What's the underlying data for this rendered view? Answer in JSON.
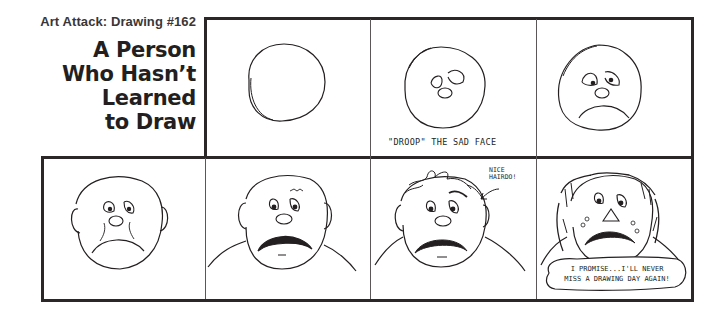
{
  "header": {
    "kicker": "Art Attack: Drawing #162",
    "title_lines": [
      "A Person",
      "Who Hasn’t",
      "Learned",
      "to Draw"
    ]
  },
  "panels": [
    {
      "index": 1,
      "row": 1,
      "description": "plain circle",
      "caption": ""
    },
    {
      "index": 2,
      "row": 1,
      "description": "circle with eyes and nose",
      "caption": "\"DROOP\" THE SAD FACE"
    },
    {
      "index": 3,
      "row": 1,
      "description": "sad face with frown",
      "caption": ""
    },
    {
      "index": 4,
      "row": 2,
      "description": "sad bald head with ears",
      "caption": ""
    },
    {
      "index": 5,
      "row": 2,
      "description": "sad head with shoulders and mustache",
      "caption": ""
    },
    {
      "index": 6,
      "row": 2,
      "description": "sad head with messy hair",
      "speech": [
        "NICE",
        "HAIRDO!"
      ]
    },
    {
      "index": 7,
      "row": 2,
      "description": "crying messy face with balloon",
      "balloon": [
        "I PROMISE...I'LL NEVER",
        "MISS A DRAWING DAY AGAIN!"
      ]
    }
  ],
  "colors": {
    "ink": "#231f20",
    "paper": "#ffffff"
  }
}
